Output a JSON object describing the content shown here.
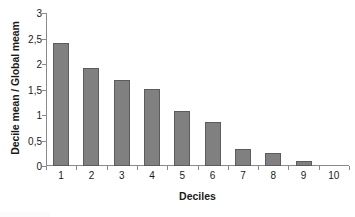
{
  "chart_data": {
    "type": "bar",
    "title": "",
    "subtitle": "",
    "xlabel": "Deciles",
    "ylabel": "Decile mean / Global meam",
    "categories": [
      "1",
      "2",
      "3",
      "4",
      "5",
      "6",
      "7",
      "8",
      "9",
      "10"
    ],
    "values": [
      2.42,
      1.93,
      1.68,
      1.51,
      1.08,
      0.87,
      0.34,
      0.25,
      0.1,
      0
    ],
    "series": [
      {
        "name": "Decile mean / Global meam",
        "values": [
          2.42,
          1.93,
          1.68,
          1.51,
          1.08,
          0.87,
          0.34,
          0.25,
          0.1,
          0
        ]
      }
    ],
    "ylim": [
      0,
      3
    ],
    "yticks": [
      0,
      0.5,
      1,
      1.5,
      2,
      2.5,
      3
    ],
    "ytick_labels": [
      "0",
      "0,5",
      "1",
      "1,5",
      "2",
      "2,5",
      "3"
    ],
    "grid": false,
    "legend": false,
    "legend_position": "none",
    "bar_color": "#808080",
    "bar_edge_color": "#5c5c5c",
    "axis_color": "#8a8a8a",
    "text_color": "#1a1a1a",
    "background": "#ffffff",
    "annotations": []
  }
}
